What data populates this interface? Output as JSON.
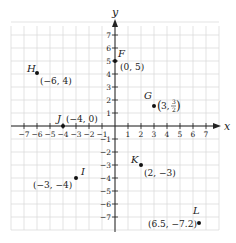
{
  "chart_data": {
    "type": "scatter",
    "title": "",
    "xlabel": "x",
    "ylabel": "y",
    "xlim": [
      -8,
      8
    ],
    "ylim": [
      -8,
      8
    ],
    "grid": true,
    "x_ticks": [
      -7,
      -6,
      -5,
      -4,
      -3,
      -2,
      -1,
      1,
      2,
      3,
      4,
      5,
      6,
      7
    ],
    "y_ticks": [
      7,
      6,
      5,
      4,
      3,
      2,
      1,
      -1,
      -2,
      -3,
      -4,
      -5,
      -6,
      -7
    ],
    "x_tick_labels": [
      "−7",
      "−6",
      "−5",
      "−4",
      "−3",
      "−2",
      "−1",
      "1",
      "2",
      "3",
      "4",
      "5",
      "6",
      "7"
    ],
    "y_tick_labels": [
      "7",
      "6",
      "5",
      "4",
      "3",
      "2",
      "1",
      "−1",
      "−2",
      "−3",
      "−4",
      "−5",
      "−6",
      "−7"
    ],
    "points": [
      {
        "name": "F",
        "x": 0,
        "y": 5,
        "coord_label": "(0, 5)"
      },
      {
        "name": "G",
        "x": 3,
        "y": 1.5,
        "coord_label": "(3, 3/2)"
      },
      {
        "name": "H",
        "x": -6,
        "y": 4,
        "coord_label": "(−6, 4)"
      },
      {
        "name": "I",
        "x": -3,
        "y": -4,
        "coord_label": "(−3, −4)"
      },
      {
        "name": "J",
        "x": -4,
        "y": 0,
        "coord_label": "(−4, 0)"
      },
      {
        "name": "K",
        "x": 2,
        "y": -3,
        "coord_label": "(2, −3)"
      },
      {
        "name": "L",
        "x": 6.5,
        "y": -7.2,
        "coord_label": "(6.5, −7.2)"
      }
    ]
  },
  "labels": {
    "x_axis": "x",
    "y_axis": "y",
    "F": {
      "name": "F",
      "coord": "(0, 5)"
    },
    "G": {
      "name": "G",
      "coord_open": "(3, ",
      "num": "3",
      "den": "2",
      "coord_close": ")"
    },
    "H": {
      "name": "H",
      "coord": "(−6, 4)"
    },
    "I": {
      "name": "I",
      "coord": "(−3, −4)"
    },
    "J": {
      "name": "J",
      "coord": "(−4, 0)"
    },
    "K": {
      "name": "K",
      "coord": "(2, −3)"
    },
    "L": {
      "name": "L",
      "coord": "(6.5, −7.2)"
    }
  },
  "colors": {
    "grid": "#dcdcdc",
    "axis": "#222222",
    "point": "#111111"
  }
}
